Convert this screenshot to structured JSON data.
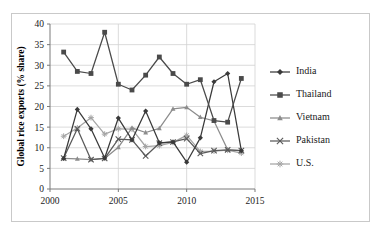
{
  "chart_data": {
    "type": "line",
    "title": "",
    "xlabel": "",
    "ylabel": "Global rice exports (% share)",
    "xlim": [
      2000,
      2015
    ],
    "ylim": [
      0,
      40
    ],
    "xticks": [
      "2000",
      "2005",
      "2010",
      "2015"
    ],
    "yticks": [
      "0",
      "5",
      "10",
      "15",
      "20",
      "25",
      "30",
      "35",
      "40"
    ],
    "grid": "horizontal-and-vertical",
    "legend_position": "right",
    "x": [
      2001,
      2002,
      2003,
      2004,
      2005,
      2006,
      2007,
      2008,
      2009,
      2010,
      2011,
      2012,
      2013,
      2014
    ],
    "series": [
      {
        "name": "India",
        "marker": "diamond",
        "color": "#3a3a3a",
        "values": [
          7.4,
          19.3,
          14.6,
          7.5,
          17.2,
          11.9,
          18.9,
          11.2,
          11.4,
          6.5,
          12.4,
          26.0,
          28.0,
          9.3
        ]
      },
      {
        "name": "Thailand",
        "marker": "square",
        "color": "#4a4a4a",
        "values": [
          33.2,
          28.5,
          28.0,
          38.0,
          25.4,
          24.0,
          27.6,
          32.0,
          28.0,
          25.4,
          26.5,
          16.6,
          16.2,
          26.8
        ]
      },
      {
        "name": "Vietnam",
        "marker": "triangle",
        "color": "#8c8c8c",
        "values": [
          7.4,
          7.3,
          7.1,
          7.4,
          10.1,
          14.8,
          13.7,
          14.7,
          19.4,
          19.8,
          17.4,
          16.5,
          9.5,
          9.3
        ]
      },
      {
        "name": "Pakistan",
        "marker": "cross",
        "color": "#5a5a5a",
        "values": [
          7.5,
          14.6,
          7.1,
          7.4,
          12.1,
          11.9,
          8.0,
          11.1,
          11.4,
          12.2,
          8.6,
          9.3,
          9.5,
          9.3
        ]
      },
      {
        "name": "U.S.",
        "marker": "asterisk",
        "color": "#a5a5a5",
        "values": [
          12.8,
          14.8,
          17.3,
          13.3,
          14.6,
          14.5,
          10.3,
          10.5,
          11.3,
          13.0,
          9.1,
          9.2,
          9.4,
          8.7
        ]
      }
    ]
  },
  "legend": {
    "items": [
      {
        "label": "India"
      },
      {
        "label": "Thailand"
      },
      {
        "label": "Vietnam"
      },
      {
        "label": "Pakistan"
      },
      {
        "label": "U.S."
      }
    ]
  }
}
